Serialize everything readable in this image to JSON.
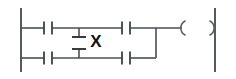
{
  "diagram": {
    "kind": "ladder-logic-rung",
    "canvas": {
      "width": 236,
      "height": 79,
      "background": "#ffffff"
    },
    "colors": {
      "rail": "#555a5e",
      "wire": "#4a4f53",
      "contact": "#3c4145",
      "plate": "#2e3234",
      "coil": "#5a5f63",
      "label": "#111111"
    },
    "rails": {
      "left": {
        "name": "left-power-rail",
        "x": 21,
        "y1": 8,
        "y2": 72
      },
      "right": {
        "name": "right-power-rail",
        "x": 215,
        "y1": 8,
        "y2": 72
      }
    },
    "rungs": [
      {
        "name": "top-rung",
        "y": 28,
        "x1": 21,
        "x2": 180
      },
      {
        "name": "bottom-rung",
        "y": 58,
        "x1": 21,
        "x2": 156
      }
    ],
    "contacts": [
      {
        "name": "contact-top-left",
        "type": "normally-open",
        "cx": 48,
        "cy": 28,
        "gap": 8,
        "height": 13
      },
      {
        "name": "contact-top-right",
        "type": "normally-open",
        "cx": 126,
        "cy": 28,
        "gap": 8,
        "height": 13
      },
      {
        "name": "contact-bottom-left",
        "type": "normally-open",
        "cx": 48,
        "cy": 58,
        "gap": 8,
        "height": 13
      },
      {
        "name": "contact-bottom-right",
        "type": "normally-open",
        "cx": 126,
        "cy": 58,
        "gap": 8,
        "height": 13
      }
    ],
    "branches": [
      {
        "name": "branch-vertical-left",
        "x": 79,
        "y1": 28,
        "y2": 58
      },
      {
        "name": "branch-vertical-right",
        "x": 156,
        "y1": 28,
        "y2": 58
      }
    ],
    "branch_element": {
      "name": "vertical-contact-element",
      "type": "contact-plates",
      "x": 79,
      "plate_top_y": 37,
      "plate_bottom_y": 49,
      "plate_half_width": 7,
      "label": "X",
      "label_x": 96,
      "label_y": 43
    },
    "coil": {
      "name": "output-coil",
      "label": "( )",
      "y": 28,
      "left_paren_x": 182,
      "right_paren_x": 212,
      "arc_radius": 8
    },
    "labels": {
      "branch_symbol": "X"
    }
  }
}
